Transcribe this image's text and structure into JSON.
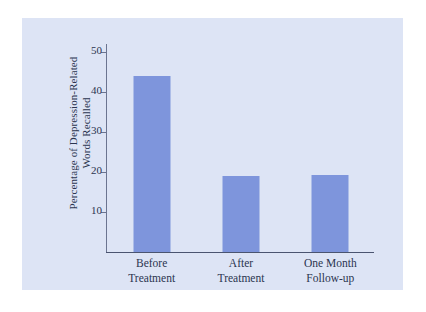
{
  "chart_data": {
    "type": "bar",
    "title": "",
    "subtitle": "",
    "xlabel": "",
    "ylabel": "Percentage of Depression-Related Words Recalled",
    "ylabel_lines": [
      "Percentage of Depression-Related",
      "Words Recalled"
    ],
    "categories": [
      "Before Treatment",
      "After Treatment",
      "One Month Follow-up"
    ],
    "category_lines": [
      [
        "Before",
        "Treatment"
      ],
      [
        "After",
        "Treatment"
      ],
      [
        "One Month",
        "Follow-up"
      ]
    ],
    "values": [
      44,
      19,
      19.3
    ],
    "ylim": [
      0,
      52
    ],
    "yticks": [
      10,
      20,
      30,
      40,
      50
    ],
    "ytick_labels": [
      "10",
      "20",
      "30",
      "40",
      "50"
    ],
    "grid": false,
    "legend": false,
    "bar_color": "#7e95dc",
    "plot_background": "#dde4f5",
    "page_background": "#ffffff",
    "axis_color": "#4a5470",
    "text_color": "#2b3550"
  }
}
